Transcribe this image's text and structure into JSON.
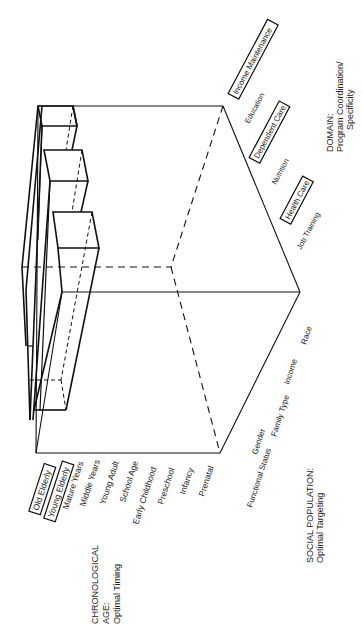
{
  "diagram": {
    "type": "3d-cube-matrix",
    "axes": {
      "age": {
        "title_line1": "CHRONOLOGICAL",
        "title_line2": "AGE:",
        "subtitle": "Optimal Timing",
        "items": [
          "Old Elderly",
          "Young Elderly",
          "Mature Years",
          "Middle Years",
          "Young Adult",
          "School Age",
          "Early Childhood",
          "Preschool",
          "Infancy",
          "Prenatal"
        ],
        "highlighted": [
          "Old Elderly",
          "Young Elderly"
        ]
      },
      "population": {
        "title": "SOCIAL POPULATION:",
        "subtitle": "Optimal Targeting",
        "items": [
          "Functional Status",
          "Gender",
          "Family Type",
          "Income",
          "Race"
        ],
        "highlighted": []
      },
      "domain": {
        "title": "DOMAIN:",
        "subtitle_line1": "Program Coordination/",
        "subtitle_line2": "Specificity",
        "items": [
          "Job Training",
          "Health Care",
          "Nutrition",
          "Dependent Care",
          "Education",
          "Income Maintenance"
        ],
        "highlighted": [
          "Health Care",
          "Dependent Care",
          "Income Maintenance"
        ]
      }
    },
    "highlighted_blocks": [
      {
        "domain": "Income Maintenance",
        "ages": [
          "Old Elderly",
          "Young Elderly"
        ]
      },
      {
        "domain": "Dependent Care",
        "ages": [
          "Old Elderly",
          "Young Elderly"
        ]
      },
      {
        "domain": "Health Care",
        "ages": [
          "Old Elderly",
          "Young Elderly"
        ]
      }
    ],
    "colors": {
      "line": "#111111",
      "text": "#222222",
      "background": "#ffffff"
    }
  }
}
